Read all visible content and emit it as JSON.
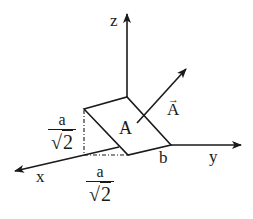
{
  "diagram": {
    "axes": {
      "z": {
        "label": "z"
      },
      "y": {
        "label": "y"
      },
      "x": {
        "label": "x"
      }
    },
    "surface": {
      "label": "A"
    },
    "vector": {
      "label": "A",
      "arrow": "→"
    },
    "labels": {
      "b": "b",
      "height_fraction": {
        "numerator": "a",
        "radical": "√",
        "denominator": "2"
      },
      "depth_fraction": {
        "numerator": "a",
        "radical": "√",
        "denominator": "2"
      }
    },
    "colors": {
      "stroke": "#1a1a1a",
      "background": "#ffffff"
    }
  }
}
